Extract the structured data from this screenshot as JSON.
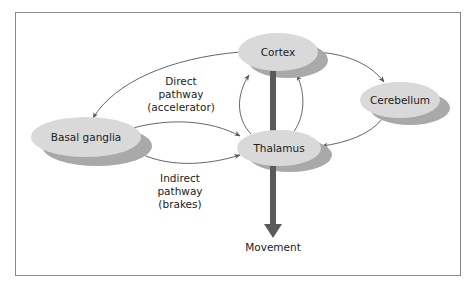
{
  "colors": {
    "node_fill": "#d9d9d9",
    "node_shadow": "#a9a9a9",
    "arrow": "#555555",
    "thick_arrow": "#5a5a5a",
    "frame": "#8a8a8a"
  },
  "nodes": {
    "cortex": {
      "label": "Cortex"
    },
    "cerebellum": {
      "label": "Cerebellum"
    },
    "basal_ganglia": {
      "label": "Basal ganglia"
    },
    "thalamus": {
      "label": "Thalamus"
    }
  },
  "pathways": {
    "direct": {
      "line1": "Direct",
      "line2": "pathway",
      "line3": "(accelerator)"
    },
    "indirect": {
      "line1": "Indirect",
      "line2": "pathway",
      "line3": "(brakes)"
    }
  },
  "output": {
    "label": "Movement"
  },
  "edges": [
    {
      "from": "cortex",
      "to": "basal_ganglia"
    },
    {
      "from": "basal_ganglia",
      "to": "thalamus",
      "type": "direct"
    },
    {
      "from": "basal_ganglia",
      "to": "thalamus",
      "type": "indirect"
    },
    {
      "from": "thalamus",
      "to": "cortex",
      "count": 2
    },
    {
      "from": "cortex",
      "to": "cerebellum"
    },
    {
      "from": "cerebellum",
      "to": "thalamus"
    },
    {
      "from": "cortex",
      "to": "movement",
      "type": "thick"
    }
  ]
}
